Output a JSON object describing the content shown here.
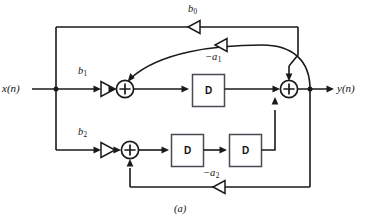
{
  "figure": {
    "caption": "(a)",
    "type": "signal-flow-block-diagram",
    "colors": {
      "wire": "#1a1a1a",
      "block_stroke": "#4a4a52",
      "background": "#ffffff"
    }
  },
  "signals": {
    "input_label": "x(n)",
    "output_label": "y(n)"
  },
  "gains": [
    {
      "id": "b0",
      "base": "b",
      "sub": "0",
      "sign": "",
      "direction": "left"
    },
    {
      "id": "b1",
      "base": "b",
      "sub": "1",
      "sign": "",
      "direction": "right"
    },
    {
      "id": "b2",
      "base": "b",
      "sub": "2",
      "sign": "",
      "direction": "right"
    },
    {
      "id": "a1",
      "base": "a",
      "sub": "1",
      "sign": "−",
      "direction": "left"
    },
    {
      "id": "a2",
      "base": "a",
      "sub": "2",
      "sign": "−",
      "direction": "left"
    }
  ],
  "delays": [
    {
      "id": "d1",
      "label": "D",
      "row": "top"
    },
    {
      "id": "d2",
      "label": "D",
      "row": "bottom"
    },
    {
      "id": "d3",
      "label": "D",
      "row": "bottom"
    }
  ],
  "adders": [
    {
      "id": "sum-top-left",
      "symbol": "+"
    },
    {
      "id": "sum-top-right",
      "symbol": "+"
    },
    {
      "id": "sum-bottom-left",
      "symbol": "+"
    }
  ]
}
